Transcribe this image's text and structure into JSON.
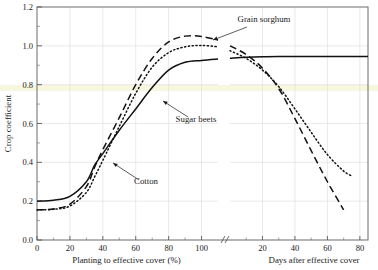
{
  "figure": {
    "background": "#ffffff",
    "frame_color": "#6b6b6b",
    "grid_color": "#dcdcdc",
    "curve_color": "#111111",
    "highlight_band_color": "#f7f4d8"
  },
  "axes": {
    "y": {
      "label": "Crop coefficient",
      "min": 0.0,
      "max": 1.2,
      "ticks": [
        "0.0",
        "0.2",
        "0.4",
        "0.6",
        "0.8",
        "1.0",
        "1.2"
      ],
      "tick_values": [
        0.0,
        0.2,
        0.4,
        0.6,
        0.8,
        1.0,
        1.2
      ],
      "minor_tick_values": [
        0.1,
        0.3,
        0.5,
        0.7,
        0.9,
        1.1
      ],
      "grid": true
    },
    "x_left": {
      "label": "Planting to effective cover (%)",
      "min": 0,
      "max": 110,
      "ticks": [
        "0",
        "20",
        "40",
        "60",
        "80",
        "100"
      ],
      "tick_values": [
        0,
        20,
        40,
        60,
        80,
        100
      ],
      "minor_tick_values": [
        10,
        30,
        50,
        70,
        90
      ],
      "grid": true
    },
    "x_right": {
      "label": "Days after effective cover",
      "min": 0,
      "max": 85,
      "ticks": [
        "20",
        "40",
        "60",
        "80"
      ],
      "tick_values": [
        20,
        40,
        60,
        80
      ],
      "minor_tick_values": [
        10,
        30,
        50,
        70
      ],
      "grid": true
    },
    "break_marker": "//"
  },
  "annotations": [
    {
      "name": "grain-sorghum",
      "text": "Grain sorghum"
    },
    {
      "name": "sugar-beets",
      "text": "Sugar beets"
    },
    {
      "name": "cotton",
      "text": "Cotton"
    }
  ],
  "chart_data": {
    "type": "line",
    "title": "",
    "xlabel": "Planting to effective cover (%)  /  Days after effective cover",
    "ylabel": "Crop coefficient",
    "ylim": [
      0.0,
      1.2
    ],
    "xlim_left": [
      0,
      110
    ],
    "xlim_right": [
      0,
      85
    ],
    "axis_break_after": 100,
    "grid": true,
    "legend": "inline-annotations",
    "series": [
      {
        "name": "Sugar beets",
        "style": "solid",
        "label_text": "Sugar beets",
        "phase1_x": [
          0,
          10,
          20,
          30,
          35,
          40,
          50,
          60,
          70,
          80,
          90,
          100,
          110
        ],
        "phase1_y": [
          0.2,
          0.205,
          0.225,
          0.3,
          0.385,
          0.445,
          0.565,
          0.675,
          0.785,
          0.875,
          0.915,
          0.925,
          0.932
        ],
        "phase2_x": [
          0,
          10,
          20,
          30,
          40,
          50,
          60,
          70,
          80,
          85
        ],
        "phase2_y": [
          0.936,
          0.941,
          0.944,
          0.945,
          0.945,
          0.945,
          0.945,
          0.945,
          0.945,
          0.945
        ]
      },
      {
        "name": "Grain sorghum",
        "style": "dashed",
        "label_text": "Grain sorghum",
        "phase1_x": [
          0,
          10,
          20,
          30,
          35,
          40,
          50,
          60,
          70,
          80,
          90,
          100,
          110
        ],
        "phase1_y": [
          0.155,
          0.16,
          0.185,
          0.275,
          0.375,
          0.465,
          0.63,
          0.8,
          0.935,
          1.02,
          1.05,
          1.048,
          1.03
        ],
        "phase2_x": [
          0,
          10,
          20,
          30,
          40,
          50,
          60,
          70
        ],
        "phase2_y": [
          1.0,
          0.955,
          0.885,
          0.78,
          0.625,
          0.46,
          0.3,
          0.155
        ]
      },
      {
        "name": "Cotton",
        "style": "dotted",
        "label_text": "Cotton",
        "phase1_x": [
          0,
          10,
          20,
          30,
          35,
          40,
          50,
          60,
          70,
          80,
          90,
          100,
          110
        ],
        "phase1_y": [
          0.155,
          0.158,
          0.175,
          0.245,
          0.325,
          0.41,
          0.585,
          0.755,
          0.89,
          0.965,
          0.995,
          1.002,
          0.995
        ],
        "phase2_x": [
          0,
          10,
          20,
          30,
          40,
          50,
          60,
          70,
          75
        ],
        "phase2_y": [
          0.975,
          0.935,
          0.875,
          0.79,
          0.675,
          0.555,
          0.44,
          0.355,
          0.33
        ]
      }
    ]
  }
}
